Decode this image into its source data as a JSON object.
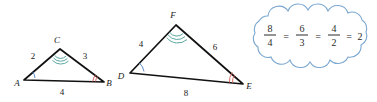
{
  "figure": {
    "name": "similar-triangles-proportion-figure",
    "colors": {
      "stroke": "#111111",
      "teal_arc": "#4a9e96",
      "blue_arc": "#4a7fc1",
      "red_arc": "#cf5c54",
      "cloud_outline": "#7ba7d0",
      "text": "#1a1a1a",
      "background": "#ffffff"
    }
  },
  "small_triangle": {
    "name": "triangle-ABC",
    "vertices": [
      {
        "label": "A",
        "x": 24,
        "y": 80,
        "label_x": 17,
        "label_y": 86
      },
      {
        "label": "B",
        "x": 104,
        "y": 82,
        "label_x": 107,
        "label_y": 86
      },
      {
        "label": "C",
        "x": 60,
        "y": 49,
        "label_x": 56,
        "label_y": 43
      }
    ],
    "sides": [
      {
        "label": "2",
        "label_x": 33,
        "label_y": 57,
        "from": "A",
        "to": "C"
      },
      {
        "label": "3",
        "label_x": 84,
        "label_y": 58,
        "from": "C",
        "to": "B"
      },
      {
        "label": "4",
        "label_x": 62,
        "label_y": 93,
        "from": "A",
        "to": "B"
      }
    ],
    "angle_marks": [
      {
        "vertex": "A",
        "style": "single",
        "color": "blue",
        "count": 1
      },
      {
        "vertex": "B",
        "style": "double",
        "color": "red",
        "count": 2
      },
      {
        "vertex": "C",
        "style": "triple",
        "color": "teal",
        "count": 3
      }
    ]
  },
  "large_triangle": {
    "name": "triangle-DEF",
    "vertices": [
      {
        "label": "D",
        "x": 130,
        "y": 73,
        "label_x": 120,
        "label_y": 79
      },
      {
        "label": "E",
        "x": 243,
        "y": 84,
        "label_x": 246,
        "label_y": 89
      },
      {
        "label": "F",
        "x": 176,
        "y": 25,
        "label_x": 172,
        "label_y": 18
      }
    ],
    "sides": [
      {
        "label": "4",
        "label_x": 142,
        "label_y": 45,
        "from": "D",
        "to": "F"
      },
      {
        "label": "6",
        "label_x": 213,
        "label_y": 48,
        "from": "F",
        "to": "E"
      },
      {
        "label": "8",
        "label_x": 186,
        "label_y": 94,
        "from": "D",
        "to": "E"
      }
    ],
    "angle_marks": [
      {
        "vertex": "D",
        "style": "single",
        "color": "blue",
        "count": 1
      },
      {
        "vertex": "E",
        "style": "double",
        "color": "red",
        "count": 2
      },
      {
        "vertex": "F",
        "style": "triple",
        "color": "teal",
        "count": 3
      }
    ]
  },
  "callout": {
    "name": "proportion-cloud-callout",
    "shape": "cloud",
    "equation_text": "8/4 = 6/3 = 4/2 = 2",
    "terms": [
      {
        "type": "fraction",
        "numerator": "8",
        "denominator": "4"
      },
      {
        "type": "operator",
        "symbol": "="
      },
      {
        "type": "fraction",
        "numerator": "6",
        "denominator": "3"
      },
      {
        "type": "operator",
        "symbol": "="
      },
      {
        "type": "fraction",
        "numerator": "4",
        "denominator": "2"
      },
      {
        "type": "operator",
        "symbol": "="
      },
      {
        "type": "value",
        "symbol": "2"
      }
    ],
    "fractions": {
      "f1_num": "8",
      "f1_den": "4",
      "f2_num": "6",
      "f2_den": "3",
      "f3_num": "4",
      "f3_den": "2",
      "result": "2",
      "eq1": "=",
      "eq2": "=",
      "eq3": "="
    }
  }
}
